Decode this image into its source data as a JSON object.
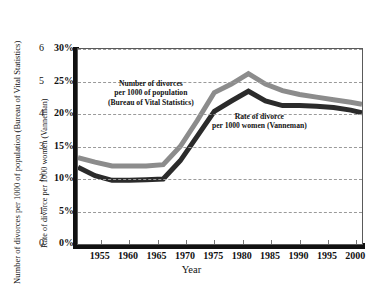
{
  "axes": {
    "left_outer_title": "Number of divorces per 1000 of population (Bureau of Vital Statistics)",
    "left_inner_title": "Rate of divorce per 1000 women (Vanneman)",
    "x_title": "Year",
    "left_outer_ticks": [
      "6",
      "5",
      "4",
      "3",
      "2",
      "1",
      "0"
    ],
    "left_inner_ticks": [
      "30%",
      "25%",
      "20%",
      "15%",
      "10%",
      "5%",
      "0%"
    ],
    "x_ticks": [
      "1955",
      "1960",
      "1965",
      "1970",
      "1975",
      "1980",
      "1985",
      "1990",
      "1995",
      "2000"
    ]
  },
  "annotations": {
    "bvs": [
      "Number of divorces",
      "per 1000 of population",
      "(Bureau of Vital Statistics)"
    ],
    "vanneman": [
      "Rate of divorce",
      "per 1000 women (Vanneman)"
    ]
  },
  "colors": {
    "series_bvs": "#8c8c8c",
    "series_vanneman": "#2b2b2b",
    "grid": "#9a9a9a",
    "frame": "#5a5a5a",
    "axis": "#111111",
    "background": "#ffffff"
  },
  "chart_data": {
    "type": "line",
    "title": "",
    "xlabel": "Year",
    "ylabel": "Rate of divorce per 1000 women (Vanneman)",
    "ylabel_secondary": "Number of divorces per 1000 of population (Bureau of Vital Statistics)",
    "xlim": [
      1951,
      2001
    ],
    "ylim": [
      0,
      30
    ],
    "ylim_secondary": [
      0,
      6
    ],
    "yticks": [
      0,
      5,
      10,
      15,
      20,
      25,
      30
    ],
    "yticks_secondary": [
      0,
      1,
      2,
      3,
      4,
      5,
      6
    ],
    "xticks": [
      1955,
      1960,
      1965,
      1970,
      1975,
      1980,
      1985,
      1990,
      1995,
      2000
    ],
    "grid": true,
    "grid_style": "dashed-horizontal",
    "legend": "inline-annotations",
    "series": [
      {
        "name": "Number of divorces per 1000 of population (Bureau of Vital Statistics)",
        "color": "#8c8c8c",
        "unit": "percent-scale",
        "x": [
          1951,
          1954,
          1957,
          1960,
          1963,
          1966,
          1969,
          1972,
          1975,
          1978,
          1981,
          1984,
          1987,
          1990,
          1993,
          1996,
          1999,
          2001
        ],
        "values": [
          13.3,
          12.6,
          12.0,
          12.0,
          12.0,
          12.2,
          15.0,
          19.0,
          23.3,
          24.6,
          26.2,
          24.6,
          23.6,
          23.0,
          22.6,
          22.2,
          21.8,
          21.5
        ]
      },
      {
        "name": "Rate of divorce per 1000 women (Vanneman)",
        "color": "#2b2b2b",
        "unit": "percent-scale",
        "x": [
          1951,
          1954,
          1957,
          1960,
          1963,
          1966,
          1969,
          1972,
          1975,
          1978,
          1981,
          1984,
          1987,
          1990,
          1993,
          1996,
          1999,
          2001
        ],
        "values": [
          11.8,
          10.5,
          9.8,
          9.8,
          9.9,
          10.0,
          12.8,
          16.6,
          20.4,
          22.0,
          23.5,
          22.0,
          21.3,
          21.3,
          21.2,
          21.0,
          20.6,
          20.2
        ]
      }
    ]
  }
}
